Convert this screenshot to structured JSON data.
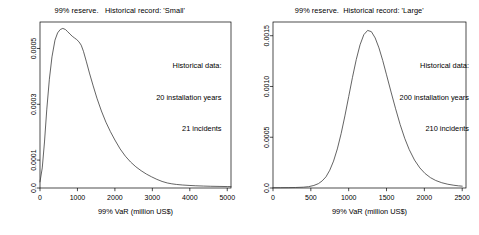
{
  "figure": {
    "panel_count": 2,
    "background": "#ffffff",
    "line_color": "#3c3c3c",
    "axis_color": "#000000"
  },
  "panels": [
    {
      "id": "small",
      "title": "99% reserve.   Historical record: 'Small'",
      "xlabel": "99% VaR (million US$)",
      "ylabel": "",
      "annotation": {
        "line1": "Historical data:",
        "line2": "20 installation years",
        "line3": "21 incidents"
      },
      "xticks": [
        "0",
        "1000",
        "2000",
        "3000",
        "4000",
        "5000"
      ],
      "yticks": [
        "0.0",
        "0.0001",
        "0.0003",
        "0.0005"
      ]
    },
    {
      "id": "large",
      "title": "99% reserve.  Historical record: 'Large'",
      "xlabel": "99% VaR (million US$)",
      "ylabel": "",
      "annotation": {
        "line1": "Historical data:",
        "line2": "200 installation years",
        "line3": "210 incidents"
      },
      "xticks": [
        "0",
        "500",
        "1000",
        "1500",
        "2000",
        "2500"
      ],
      "yticks": [
        "0.0",
        "0.0005",
        "0.0010",
        "0.0015"
      ]
    }
  ],
  "chart_data": [
    {
      "type": "line",
      "panel": "small",
      "title": "99% reserve.   Historical record: 'Small'",
      "xlabel": "99% VaR (million US$)",
      "ylabel": "",
      "xlim": [
        0,
        5100
      ],
      "ylim": [
        0,
        0.000595
      ],
      "xticks": [
        0,
        1000,
        2000,
        3000,
        4000,
        5000
      ],
      "yticks": [
        0.0,
        0.0001,
        0.0003,
        0.0005
      ],
      "ytick_labels": [
        "0.0",
        "0.0001",
        "0.0003",
        "0.0005"
      ],
      "grid": false,
      "legend": null,
      "annotations": [
        "Historical data:",
        "20 installation years",
        "21 incidents"
      ],
      "series": [
        {
          "name": "density-small",
          "x": [
            0,
            60,
            120,
            180,
            250,
            320,
            400,
            470,
            540,
            610,
            680,
            740,
            800,
            860,
            920,
            980,
            1040,
            1100,
            1160,
            1240,
            1320,
            1420,
            1520,
            1640,
            1760,
            1880,
            2000,
            2140,
            2280,
            2420,
            2560,
            2700,
            2840,
            2980,
            3120,
            3260,
            3400,
            3520,
            3640,
            3800,
            3980,
            4160,
            4360,
            4560,
            4780,
            5000,
            5100
          ],
          "y": [
            2.2e-05,
            7.2e-05,
            0.000165,
            0.00028,
            0.00039,
            0.00047,
            0.00053,
            0.000556,
            0.000568,
            0.000572,
            0.000568,
            0.00056,
            0.000552,
            0.000544,
            0.000538,
            0.000532,
            0.000524,
            0.000512,
            0.00049,
            0.000452,
            0.000412,
            0.000366,
            0.000322,
            0.000276,
            0.000236,
            0.000202,
            0.000172,
            0.00014,
            0.000114,
            9.3e-05,
            7.6e-05,
            6.2e-05,
            5e-05,
            4e-05,
            3.1e-05,
            2.35e-05,
            1.8e-05,
            1.5e-05,
            1.28e-05,
            1.08e-05,
            9.2e-06,
            8e-06,
            7e-06,
            6.2e-06,
            5.7e-06,
            5.2e-06,
            5e-06
          ]
        }
      ]
    },
    {
      "type": "line",
      "panel": "large",
      "title": "99% reserve.  Historical record: 'Large'",
      "xlabel": "99% VaR (million US$)",
      "ylabel": "",
      "xlim": [
        0,
        2550
      ],
      "ylim": [
        0,
        0.001635
      ],
      "xticks": [
        0,
        500,
        1000,
        1500,
        2000,
        2500
      ],
      "yticks": [
        0.0,
        0.0005,
        0.001,
        0.0015
      ],
      "ytick_labels": [
        "0.0",
        "0.0005",
        "0.0010",
        "0.0015"
      ],
      "grid": false,
      "legend": null,
      "annotations": [
        "Historical data:",
        "200 installation years",
        "210 incidents"
      ],
      "series": [
        {
          "name": "density-large",
          "x": [
            0,
            100,
            200,
            300,
            400,
            470,
            540,
            600,
            650,
            700,
            750,
            800,
            850,
            900,
            950,
            1000,
            1050,
            1100,
            1150,
            1200,
            1250,
            1300,
            1350,
            1400,
            1450,
            1500,
            1560,
            1620,
            1680,
            1740,
            1800,
            1870,
            1940,
            2010,
            2080,
            2150,
            2230,
            2310,
            2390,
            2450,
            2500
          ],
          "y": [
            3e-06,
            3.2e-06,
            3.8e-06,
            5e-06,
            8e-06,
            1.3e-05,
            2.5e-05,
            4.3e-05,
            7e-05,
            0.00011,
            0.000175,
            0.000265,
            0.000385,
            0.000535,
            0.00071,
            0.0009,
            0.00109,
            0.001265,
            0.00141,
            0.00151,
            0.001552,
            0.00154,
            0.001478,
            0.00138,
            0.001255,
            0.001115,
            0.000945,
            0.00078,
            0.000625,
            0.00049,
            0.000378,
            0.000275,
            0.000198,
            0.000142,
            0.000102,
            7.4e-05,
            5.2e-05,
            3.7e-05,
            2.7e-05,
            2.15e-05,
            1.8e-05
          ]
        }
      ]
    }
  ]
}
